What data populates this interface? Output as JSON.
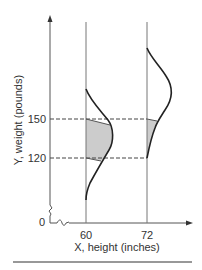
{
  "diagram": {
    "type": "regression-conditional-distributions",
    "x_axis": {
      "label": "X, height (inches)",
      "ticks": [
        "60",
        "72"
      ],
      "origin_label": "0"
    },
    "y_axis": {
      "label": "Y, weight (pounds)",
      "ticks": [
        "150",
        "120"
      ]
    },
    "distributions": [
      {
        "x": "60",
        "shaded_range": [
          "120",
          "150"
        ]
      },
      {
        "x": "72",
        "shaded_range": [
          "120",
          "150"
        ]
      }
    ],
    "colors": {
      "line": "#222222",
      "axis": "#555555",
      "shade": "#cccccc",
      "dash": "#444444"
    }
  }
}
